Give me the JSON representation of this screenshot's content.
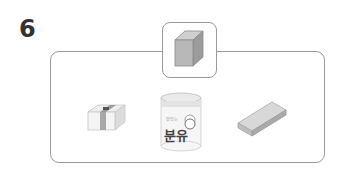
{
  "question": {
    "number": "6"
  },
  "reference": {
    "shape": "cube",
    "label": "cube-reference"
  },
  "options": [
    {
      "name": "bundle",
      "description": "stacked paper bundle (rectangular box)"
    },
    {
      "name": "formula-can",
      "description": "cylindrical can",
      "label_text": "분유",
      "small_text": "맛있는"
    },
    {
      "name": "eraser",
      "description": "rectangular eraser"
    }
  ],
  "colors": {
    "border": "#9a9a9a",
    "cube": "#b3b3b3",
    "number": "#333333"
  }
}
